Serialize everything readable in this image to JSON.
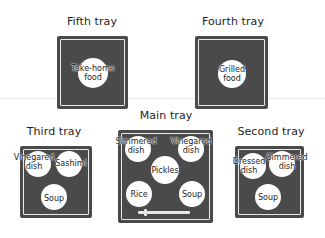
{
  "trays": {
    "fifth": {
      "title": "Fifth tray",
      "dishes": [
        "Take-home\nfood"
      ]
    },
    "fourth": {
      "title": "Fourth tray",
      "dishes": [
        "Grilled\nfood"
      ]
    },
    "third": {
      "title": "Third tray",
      "dishes": [
        "Vinegared\ndish",
        "Sashimi",
        "Soup"
      ]
    },
    "main": {
      "title": "Main tray",
      "dishes": [
        "Simmered\ndish",
        "Vinegared\ndish",
        "Pickles",
        "Rice",
        "Soup"
      ],
      "utensil": "chopsticks"
    },
    "second": {
      "title": "Second tray",
      "dishes": [
        "Dressed\ndish",
        "Simmered\ndish",
        "Soup"
      ]
    }
  },
  "colors": {
    "tray": "#4a4a4a",
    "dish": "#ffffff",
    "border": "#e8e8e8"
  }
}
